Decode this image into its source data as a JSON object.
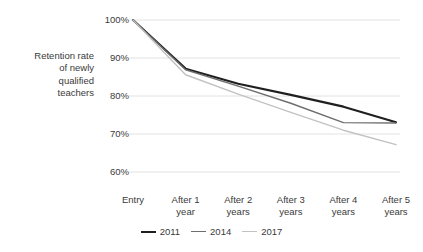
{
  "chart_data": {
    "type": "line",
    "title": "",
    "xlabel": "",
    "ylabel": "Retention rate\nof newly\nqualified\nteachers",
    "categories": [
      "Entry",
      "After 1\nyear",
      "After 2\nyears",
      "After 3\nyears",
      "After 4\nyears",
      "After 5\nyears"
    ],
    "ytick_labels": [
      "100%",
      "90%",
      "80%",
      "70%",
      "60%"
    ],
    "ytick_values": [
      100,
      90,
      80,
      70,
      60
    ],
    "ylim": [
      58,
      101
    ],
    "grid": "horizontal",
    "legend_position": "bottom-center",
    "series": [
      {
        "name": "2011",
        "color": "#1f1f1f",
        "width": 2.1,
        "values": [
          100,
          87.2,
          83.2,
          80.3,
          77.2,
          73.1
        ]
      },
      {
        "name": "2014",
        "color": "#6e6e6e",
        "width": 1.4,
        "values": [
          100,
          86.9,
          82.6,
          78.1,
          73.0,
          72.9
        ]
      },
      {
        "name": "2017",
        "color": "#c2c2c2",
        "width": 1.4,
        "values": [
          100,
          85.6,
          80.5,
          75.7,
          71.0,
          67.2
        ]
      }
    ]
  },
  "colors": {
    "gridline": "#e2e2e2",
    "text": "#3a3a3a",
    "background": "#ffffff"
  }
}
